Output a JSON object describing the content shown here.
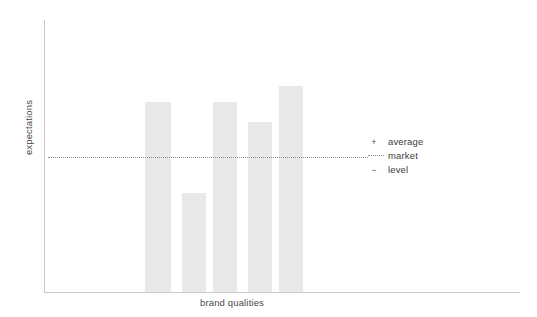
{
  "chart_data": {
    "type": "bar",
    "title": "",
    "subtitle": "",
    "xlabel": "brand qualities",
    "ylabel": "expectations",
    "categories": [
      "1",
      "2",
      "3",
      "4",
      "5"
    ],
    "values": [
      88,
      45,
      88,
      78,
      96
    ],
    "ylim": [
      0,
      127
    ],
    "grid": false,
    "legend_position": "right",
    "bar_color": "#e9e9e9",
    "axis_color": "#c9c9c9",
    "reference_line": {
      "label": "average market level",
      "value": 61,
      "style": "dotted",
      "color": "#8d8d8d"
    },
    "annotations": [
      {
        "symbol": "+",
        "text": "average"
      },
      {
        "symbol": "dotted-line",
        "text": "market"
      },
      {
        "symbol": "−",
        "text": "level"
      }
    ],
    "bar_geometry": [
      {
        "left": 145,
        "width": 26,
        "top": 102
      },
      {
        "left": 182,
        "width": 24,
        "top": 193
      },
      {
        "left": 213,
        "width": 24,
        "top": 102
      },
      {
        "left": 248,
        "width": 24,
        "top": 122
      },
      {
        "left": 279,
        "width": 24,
        "top": 86
      }
    ],
    "baseline_y": 292
  },
  "axes": {
    "y_title": "expectations",
    "x_title": "brand qualities"
  },
  "legend": {
    "rows": [
      {
        "mark": "+",
        "label": "average"
      },
      {
        "mark": "",
        "label": "market"
      },
      {
        "mark": "−",
        "label": "level"
      }
    ]
  }
}
